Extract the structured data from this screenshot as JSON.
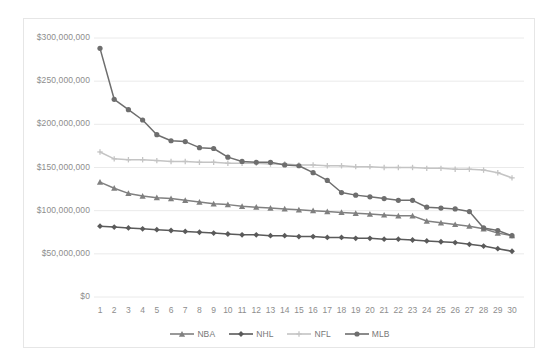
{
  "chart_data": {
    "type": "line",
    "title": "",
    "xlabel": "",
    "ylabel": "",
    "xlim": [
      1,
      30
    ],
    "ylim": [
      0,
      300000000
    ],
    "grid": true,
    "legend_position": "bottom",
    "x": [
      1,
      2,
      3,
      4,
      5,
      6,
      7,
      8,
      9,
      10,
      11,
      12,
      13,
      14,
      15,
      16,
      17,
      18,
      19,
      20,
      21,
      22,
      23,
      24,
      25,
      26,
      27,
      28,
      29,
      30
    ],
    "xtick_labels": [
      "1",
      "2",
      "3",
      "4",
      "5",
      "6",
      "7",
      "8",
      "9",
      "10",
      "11",
      "12",
      "13",
      "14",
      "15",
      "16",
      "17",
      "18",
      "19",
      "20",
      "21",
      "22",
      "23",
      "24",
      "25",
      "26",
      "27",
      "28",
      "29",
      "30"
    ],
    "ytick_labels": [
      "$0",
      "$50,000,000",
      "$100,000,000",
      "$150,000,000",
      "$200,000,000",
      "$250,000,000",
      "$300,000,000"
    ],
    "ytick_values": [
      0,
      50000000,
      100000000,
      150000000,
      200000000,
      250000000,
      300000000
    ],
    "series": [
      {
        "name": "NBA",
        "color": "#808080",
        "marker": "triangle",
        "values": [
          133000000,
          126000000,
          120000000,
          117000000,
          115000000,
          114000000,
          112000000,
          110000000,
          108000000,
          107000000,
          105000000,
          104000000,
          103000000,
          102000000,
          101000000,
          100000000,
          99000000,
          98000000,
          97000000,
          96000000,
          95000000,
          94000000,
          94000000,
          88000000,
          86000000,
          84000000,
          82000000,
          79000000,
          74000000,
          71000000
        ]
      },
      {
        "name": "NHL",
        "color": "#5a5a5a",
        "marker": "diamond",
        "values": [
          82000000,
          81000000,
          80000000,
          79000000,
          78000000,
          77000000,
          76000000,
          75000000,
          74000000,
          73000000,
          72000000,
          72000000,
          71000000,
          71000000,
          70000000,
          70000000,
          69000000,
          69000000,
          68000000,
          68000000,
          67000000,
          67000000,
          66000000,
          65000000,
          64000000,
          63000000,
          61000000,
          59000000,
          56000000,
          53000000
        ]
      },
      {
        "name": "NFL",
        "color": "#c4c4c4",
        "marker": "plus",
        "values": [
          168000000,
          160000000,
          159000000,
          159000000,
          158000000,
          157000000,
          157000000,
          156000000,
          156000000,
          155000000,
          155000000,
          155000000,
          154000000,
          154000000,
          153000000,
          153000000,
          152000000,
          152000000,
          151000000,
          151000000,
          150000000,
          150000000,
          150000000,
          149000000,
          149000000,
          148000000,
          148000000,
          147000000,
          144000000,
          138000000
        ]
      },
      {
        "name": "MLB",
        "color": "#6e6e6e",
        "marker": "circle",
        "values": [
          288000000,
          229000000,
          217000000,
          205000000,
          188000000,
          181000000,
          180000000,
          173000000,
          172000000,
          162000000,
          157000000,
          156000000,
          156000000,
          153000000,
          152000000,
          144000000,
          135000000,
          121000000,
          118000000,
          116000000,
          114000000,
          112000000,
          112000000,
          104000000,
          103000000,
          102000000,
          99000000,
          80000000,
          77000000,
          71000000
        ]
      }
    ]
  },
  "legend": {
    "entries": [
      {
        "label": "NBA"
      },
      {
        "label": "NHL"
      },
      {
        "label": "NFL"
      },
      {
        "label": "MLB"
      }
    ]
  }
}
